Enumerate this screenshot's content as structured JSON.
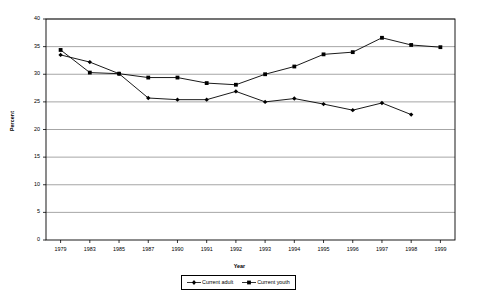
{
  "chart_data": {
    "type": "line",
    "title": "",
    "xlabel": "Year",
    "ylabel": "Percent",
    "ylim": [
      0,
      40
    ],
    "ytick_step": 5,
    "yticks": [
      "0",
      "5",
      "10",
      "15",
      "20",
      "25",
      "30",
      "35",
      "40"
    ],
    "grid": true,
    "grid_axis": "y",
    "legend_position": "bottom",
    "categories": [
      "1979",
      "1983",
      "1985",
      "1987",
      "1990",
      "1991",
      "1992",
      "1993",
      "1994",
      "1995",
      "1996",
      "1997",
      "1998",
      "1999"
    ],
    "series": [
      {
        "name": "Current adult",
        "marker": "diamond",
        "color": "#000000",
        "values": [
          33.5,
          32.2,
          30.1,
          25.7,
          25.4,
          25.4,
          26.9,
          25.0,
          25.6,
          24.6,
          23.5,
          24.8,
          22.7,
          null
        ]
      },
      {
        "name": "Current youth",
        "marker": "square",
        "color": "#000000",
        "values": [
          34.4,
          30.3,
          30.1,
          29.4,
          29.4,
          28.4,
          28.1,
          30.0,
          31.4,
          33.6,
          34.0,
          36.6,
          35.3,
          34.9
        ]
      }
    ]
  },
  "legend": {
    "items": [
      {
        "label": "Current adult"
      },
      {
        "label": "Current youth"
      }
    ]
  },
  "colors": {
    "plot_border": "#000000",
    "gridline": "#808080",
    "series": "#000000",
    "background": "#ffffff"
  }
}
